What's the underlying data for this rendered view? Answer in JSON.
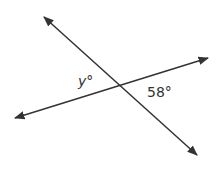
{
  "diagram": {
    "type": "intersecting-lines",
    "line_color": "#333333",
    "lines": [
      {
        "name": "line-a",
        "x1": 44,
        "y1": 17,
        "x2": 197,
        "y2": 155
      },
      {
        "name": "line-b",
        "x1": 15,
        "y1": 118,
        "x2": 208,
        "y2": 58
      }
    ],
    "intersection": {
      "x": 120,
      "y": 86
    },
    "labels": {
      "y_angle": "y°",
      "known_angle": "58°"
    }
  }
}
